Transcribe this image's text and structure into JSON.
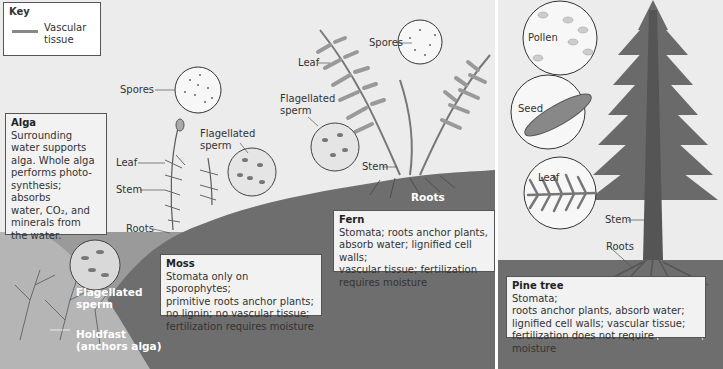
{
  "key": {
    "title": "Key",
    "item_label": "Vascular\ntissue",
    "item_color": "#888888"
  },
  "alga": {
    "box_title": "Alga",
    "box_text": "Surrounding\nwater supports\nalga. Whole alga\nperforms photo-\nsynthesis; absorbs\nwater, CO₂, and\nminerals from\nthe water.",
    "labels": {
      "flagellated_sperm": "Flagellated\nsperm",
      "holdfast": "Holdfast\n(anchors alga)"
    }
  },
  "moss": {
    "box_title": "Moss",
    "box_text": "Stomata only on sporophytes;\nprimitive roots anchor plants;\nno lignin;  no vascular tissue;\nfertilization requires moisture",
    "labels": {
      "spores": "Spores",
      "flagellated_sperm": "Flagellated\nsperm",
      "leaf": "Leaf",
      "stem": "Stem",
      "roots": "Roots"
    }
  },
  "fern": {
    "box_title": "Fern",
    "box_text": "Stomata;  roots anchor plants,\nabsorb water;  lignified cell walls;\nvascular tissue; fertilization\nrequires moisture",
    "labels": {
      "spores": "Spores",
      "leaf": "Leaf",
      "flagellated_sperm": "Flagellated\nsperm",
      "stem": "Stem",
      "roots": "Roots"
    }
  },
  "pine": {
    "box_title": "Pine tree",
    "box_text": "Stomata;\nroots anchor plants, absorb water;\nlignified cell walls;  vascular tissue;\nfertilization does not require moisture",
    "labels": {
      "pollen": "Pollen",
      "seed": "Seed",
      "leaf": "Leaf",
      "stem": "Stem",
      "roots": "Roots"
    }
  },
  "colors": {
    "background": "#ececec",
    "ground": "#6e6e6e",
    "water": "#9a9a9a",
    "foliage": "#7a7a7a",
    "box_fill": "#f2f2f2",
    "border": "#555555"
  }
}
